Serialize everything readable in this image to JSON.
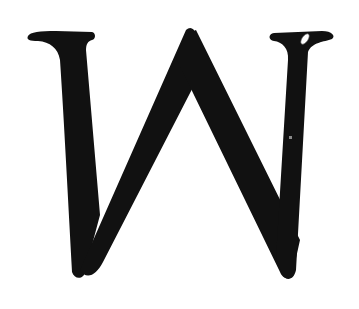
{
  "image": {
    "letter": "W",
    "description": "Large black serif capital letter W on white background",
    "colors": {
      "background": "#ffffff",
      "glyph": "#111111",
      "highlight": "#ffffff"
    }
  }
}
